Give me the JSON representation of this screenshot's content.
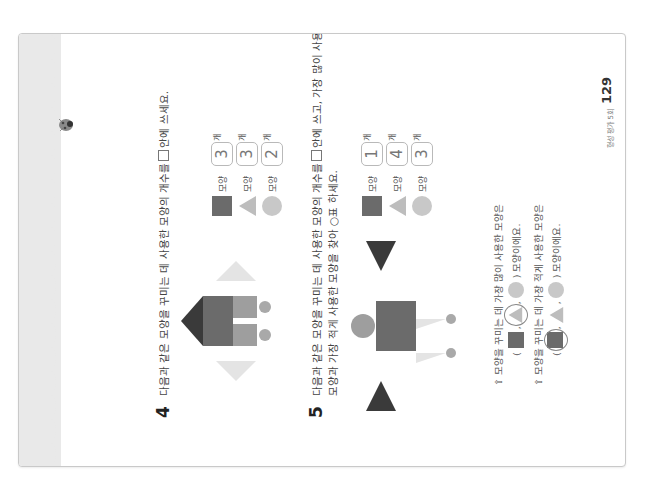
{
  "page": {
    "orientation": "rotated 90° counter-clockwise",
    "page_number": "129",
    "footer_label": "형성 평가 5회"
  },
  "colors": {
    "square": "#6b6b6b",
    "triangle_light": "#bdbdbd",
    "triangle_dark": "#3a3a3a",
    "circle": "#c8c8c8",
    "strip": "#e9e9e9"
  },
  "question4": {
    "number": "4",
    "text_before_box": "다음과 같은 모양을 꾸미는 데 사용한 모양의 개수를",
    "text_after_box": "안에 쓰세요.",
    "counts": [
      {
        "shape": "square",
        "label": "모양",
        "value": "3",
        "unit": "개"
      },
      {
        "shape": "triangle",
        "label": "모양",
        "value": "3",
        "unit": "개"
      },
      {
        "shape": "circle",
        "label": "모양",
        "value": "2",
        "unit": "개"
      }
    ]
  },
  "question5": {
    "number": "5",
    "line1_before_box": "다음과 같은 모양을 꾸미는 데 사용한 모양의 개수를",
    "line1_after_box": "안에 쓰고, 가장 많이 사용한",
    "line2": "모양과 가장 적게 사용한 모양을 찾아 ○표 하세요.",
    "counts": [
      {
        "shape": "square",
        "label": "모양",
        "value": "1",
        "unit": "개"
      },
      {
        "shape": "triangle",
        "label": "모양",
        "value": "4",
        "unit": "개"
      },
      {
        "shape": "circle",
        "label": "모양",
        "value": "3",
        "unit": "개"
      }
    ],
    "sub_questions": [
      {
        "prompt": "⇧ 모양을 꾸미는 데 가장 많이 사용한 모양은",
        "open_paren": "(",
        "close_paren": ")",
        "suffix": "모양이에요.",
        "circled": "triangle"
      },
      {
        "prompt": "⇧ 모양을 꾸미는 데 가장 적게 사용한 모양은",
        "open_paren": "(",
        "close_paren": ")",
        "suffix": "모양이에요.",
        "circled": "square"
      }
    ],
    "separator": ","
  }
}
